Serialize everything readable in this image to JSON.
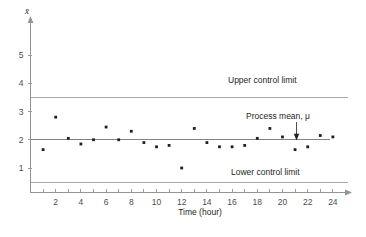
{
  "chart_data": {
    "type": "scatter",
    "title": "",
    "xlabel": "Time (hour)",
    "ylabel": "x̄",
    "xlim": [
      0,
      25.2
    ],
    "ylim": [
      0,
      5.85
    ],
    "grid": false,
    "x": [
      1,
      2,
      3,
      4,
      5,
      6,
      7,
      8,
      9,
      10,
      11,
      12,
      13,
      14,
      15,
      16,
      17,
      18,
      19,
      20,
      21,
      22,
      23,
      24
    ],
    "values": [
      1.65,
      2.8,
      2.05,
      1.85,
      2.0,
      2.45,
      2.0,
      2.3,
      1.9,
      1.75,
      1.8,
      1.0,
      2.4,
      1.9,
      1.75,
      1.75,
      1.8,
      2.05,
      2.4,
      2.1,
      1.65,
      1.75,
      2.15,
      2.1
    ],
    "xticks": [
      1,
      2,
      3,
      4,
      5,
      6,
      7,
      8,
      9,
      10,
      11,
      12,
      13,
      14,
      15,
      16,
      17,
      18,
      19,
      20,
      21,
      22,
      23,
      24
    ],
    "xtick_labels": [
      "",
      "2",
      "",
      "4",
      "",
      "6",
      "",
      "8",
      "",
      "10",
      "",
      "12",
      "",
      "14",
      "",
      "16",
      "",
      "18",
      "",
      "20",
      "",
      "22",
      "",
      "24"
    ],
    "yticks": [
      1,
      2,
      3,
      4,
      5
    ],
    "ytick_labels": [
      "1",
      "2",
      "3",
      "4",
      "5"
    ],
    "reference_lines": [
      {
        "name": "upper-control-limit",
        "label": "Upper control limit",
        "value": 3.5
      },
      {
        "name": "process-mean",
        "label": "Process mean, μ",
        "value": 2.0
      },
      {
        "name": "lower-control-limit",
        "label": "Lower control limit",
        "value": 0.5
      }
    ],
    "colors": {
      "point": "#231f20",
      "limit_line": "#a7a9ac",
      "mean_line": "#808285",
      "axis": "#939598",
      "text": "#231f20"
    }
  },
  "axis": {
    "y_symbol": "x̄",
    "x_title": "Time (hour)"
  },
  "annotations": {
    "upper_control_limit": "Upper control limit",
    "process_mean": "Process mean, μ",
    "lower_control_limit": "Lower control limit"
  }
}
